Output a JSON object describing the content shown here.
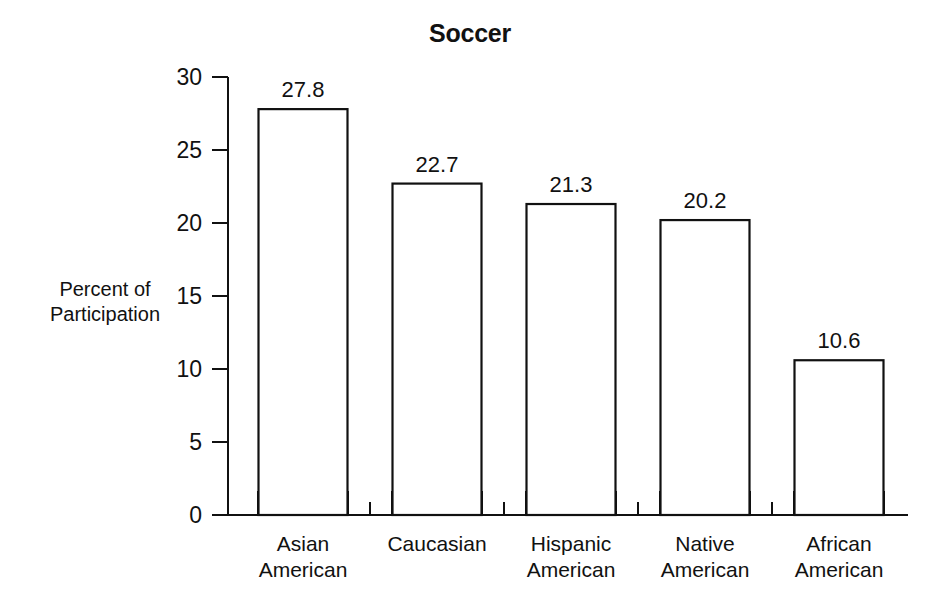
{
  "chart_data": {
    "type": "bar",
    "title": "Soccer",
    "xlabel": "",
    "ylabel": "Percent of Participation",
    "ylabel_lines": [
      "Percent of",
      "Participation"
    ],
    "categories": [
      "Asian American",
      "Caucasian",
      "Hispanic American",
      "Native American",
      "African American"
    ],
    "category_lines": [
      [
        "Asian",
        "American"
      ],
      [
        "Caucasian",
        ""
      ],
      [
        "Hispanic",
        "American"
      ],
      [
        "Native",
        "American"
      ],
      [
        "African",
        "American"
      ]
    ],
    "values": [
      27.8,
      22.7,
      21.3,
      20.2,
      10.6
    ],
    "value_labels": [
      "27.8",
      "22.7",
      "21.3",
      "20.2",
      "10.6"
    ],
    "ylim": [
      0,
      30
    ],
    "yticks": [
      0,
      5,
      10,
      15,
      20,
      25,
      30
    ],
    "ytick_labels": [
      "0",
      "5",
      "10",
      "15",
      "20",
      "25",
      "30"
    ],
    "grid": false,
    "legend": false,
    "bar_fill": "#ffffff",
    "bar_stroke": "#111111",
    "axis_color": "#111111",
    "background": "#ffffff"
  }
}
